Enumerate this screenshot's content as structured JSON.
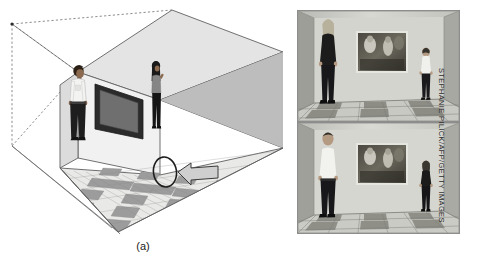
{
  "figure": {
    "background_color": "#ffffff"
  },
  "panel_a": {
    "label": "(a)",
    "name": "ames-room-diagram",
    "description": "Cutaway perspective diagram of a distorted Ames room with two people standing against the rear wall, a framed picture, a checkerboard floor, and dashed sight lines converging to a peephole viewpoint.",
    "elements": {
      "left_person_label": "man in white shirt at far left corner",
      "right_person_label": "woman in dark clothing at near right corner",
      "picture_frame_label": "framed picture on rear wall",
      "viewpoint_marker_label": "peephole viewing position",
      "arrow_label": "viewing direction arrow",
      "sightline_label": "dashed line of sight to vanishing point"
    },
    "colors": {
      "ceiling": "#e3e3e3",
      "back_wall": "#f2f2f2",
      "right_wall": "#b8b8b8",
      "left_wall": "#d6d6d6",
      "floor_light": "#e8e8e6",
      "floor_dark": "#9a9a9a",
      "outline": "#5e5e5e",
      "dashes": "#6a6a6a",
      "frame": "#2a2a2a",
      "frame_inner": "#6d6d6d",
      "skin": "#8a6a52",
      "shirt_light": "#f4f4f2",
      "clothing_dark": "#232323"
    }
  },
  "panel_b": {
    "label": "(b)",
    "name": "ames-room-photographs",
    "photos": [
      {
        "id": "photo-top",
        "caption_text": "",
        "description": "Photograph of the Ames room: a tall-looking person stands at the left corner, a small-looking person stands at the right corner, with a framed painting on the rear wall and a checkerboard floor."
      },
      {
        "id": "photo-bottom",
        "caption_text": "",
        "description": "The same room with the two people having swapped corners, reversing their apparent sizes."
      }
    ]
  },
  "credit": {
    "text": "STEPHANIE PILICK/AFP/GETTY IMAGES"
  }
}
